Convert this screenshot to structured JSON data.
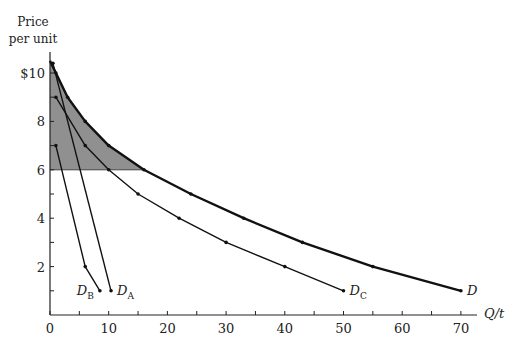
{
  "chart_data": {
    "type": "line",
    "title": "",
    "xlabel": "Q/t",
    "ylabel": "Price per unit",
    "xlim": [
      0,
      72
    ],
    "ylim": [
      0,
      10.8
    ],
    "x_ticks": [
      0,
      10,
      20,
      30,
      40,
      50,
      60,
      70
    ],
    "x_minor_ticks": [
      5,
      15,
      25,
      35,
      45,
      55,
      65
    ],
    "y_ticks": [
      {
        "value": 10,
        "label": "$10"
      },
      {
        "value": 8,
        "label": "8"
      },
      {
        "value": 6,
        "label": "6"
      },
      {
        "value": 4,
        "label": "4"
      },
      {
        "value": 2,
        "label": "2"
      }
    ],
    "y_minor_ticks": [
      1,
      3,
      5,
      7,
      9
    ],
    "grid": false,
    "legend": null,
    "series": [
      {
        "name": "D",
        "label": "D",
        "sub": "",
        "style": "thick",
        "points": [
          [
            0,
            10.5
          ],
          [
            1,
            10
          ],
          [
            3,
            9
          ],
          [
            6,
            8
          ],
          [
            10,
            7
          ],
          [
            16,
            6
          ],
          [
            24,
            5
          ],
          [
            33,
            4
          ],
          [
            43,
            3
          ],
          [
            55,
            2
          ],
          [
            70,
            1
          ]
        ]
      },
      {
        "name": "D_A",
        "label": "D",
        "sub": "A",
        "style": "thin",
        "points": [
          [
            0.5,
            10.4
          ],
          [
            10.4,
            1
          ]
        ]
      },
      {
        "name": "D_B",
        "label": "D",
        "sub": "B",
        "style": "thin",
        "points": [
          [
            1,
            7
          ],
          [
            6,
            2
          ],
          [
            8.5,
            1
          ]
        ]
      },
      {
        "name": "D_C",
        "label": "D",
        "sub": "C",
        "style": "thin",
        "points": [
          [
            1,
            9
          ],
          [
            6,
            7
          ],
          [
            10,
            6
          ],
          [
            15,
            5
          ],
          [
            22,
            4
          ],
          [
            30,
            3
          ],
          [
            40,
            2
          ],
          [
            50,
            1
          ]
        ]
      }
    ],
    "annotations": [
      {
        "type": "shaded_area",
        "description": "Consumer surplus region above price $6 under market demand D",
        "price_floor": 6,
        "color": "#8a8a8a"
      }
    ]
  },
  "labels": {
    "y_axis_line1": "Price",
    "y_axis_line2": "per unit",
    "x_axis": "Q/t"
  }
}
